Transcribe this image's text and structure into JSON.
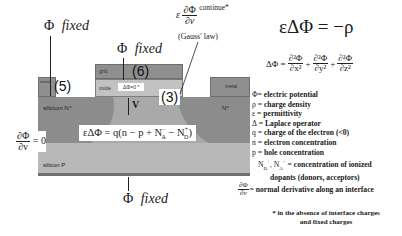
{
  "title_equation": {
    "lhs": "εΔΦ",
    "equals": "=",
    "rhs": "−ρ"
  },
  "laplacian": {
    "lhs": "ΔΦ =",
    "terms": [
      {
        "num": "∂²Φ",
        "den": "∂x²"
      },
      {
        "num": "∂²Φ",
        "den": "∂y²"
      },
      {
        "num": "∂²Φ",
        "den": "∂z²"
      }
    ],
    "plus": "+"
  },
  "boundary_labels": {
    "top_left": {
      "symbol": "Φ",
      "text": "fixed"
    },
    "top_gate": {
      "symbol": "Φ",
      "text": "fixed"
    },
    "bottom": {
      "symbol": "Φ",
      "text": "fixed"
    },
    "neumann": {
      "num": "∂Φ",
      "den": "∂v",
      "rhs": "= 0"
    },
    "gauss": {
      "prefix": "ε",
      "num": "∂Φ",
      "den": "∂v",
      "suffix": "continue*",
      "note": "(Gauss' law)"
    }
  },
  "device": {
    "metal_left": "metal",
    "metal_right": "metal",
    "grid": "grid",
    "oxide": "oxide",
    "oxide_eq": "ΔΦ=0 *",
    "silicon_n_left": "silicium N⁺",
    "n_right": "N⁺",
    "silicon_p": "silicon P",
    "region_5": "(5)",
    "region_6": "(6)",
    "region_3": "(3)",
    "v_label": "V",
    "poisson": "εΔΦ = q(n − p + N",
    "poisson_na": "A",
    "poisson_na_sup": "−",
    "poisson_mid": " − N",
    "poisson_nd": "D",
    "poisson_nd_sup": "+",
    "poisson_end": ")"
  },
  "legend": [
    {
      "sym": "Φ",
      "text": "= electric potential"
    },
    {
      "sym": "ρ",
      "text": "= charge density"
    },
    {
      "sym": "ε",
      "text": "= permittivity"
    },
    {
      "sym": "Δ",
      "text": "=  Laplace operator"
    },
    {
      "sym": "q",
      "text": "= charge of the electron (<0)"
    },
    {
      "sym": "n",
      "text": " = electron concentration"
    },
    {
      "sym": "p",
      "text": "= hole concentration"
    },
    {
      "sym": "N_D⁺, N_A⁻",
      "text": "= concentration of ionized"
    },
    {
      "sym": "",
      "text": "dopants (donors, acceptors)"
    },
    {
      "sym": "∂Φ/∂v",
      "text": "= normal derivative along an interface"
    }
  ],
  "footnote": {
    "line1": "* in the absence of interface charges",
    "line2": "and fixed charges"
  }
}
